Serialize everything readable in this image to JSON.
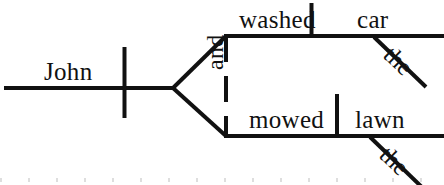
{
  "diagram": {
    "type": "reed-kellogg-sentence-diagram",
    "sentence": "John washed the car and mowed the lawn.",
    "stroke_color": "#111111",
    "background_color": "#ffffff",
    "subject": {
      "label": "John",
      "role": "subject"
    },
    "conjunction": {
      "label": "and",
      "role": "coordinating-conjunction",
      "orientation": "vertical-rotated"
    },
    "branches": [
      {
        "position": "upper",
        "verb": "washed",
        "object": "car",
        "modifier": "the"
      },
      {
        "position": "lower",
        "verb": "mowed",
        "object": "lawn",
        "modifier": "the"
      }
    ],
    "labels": {
      "john": "John",
      "and": "and",
      "washed": "washed",
      "car": "car",
      "the_upper": "the",
      "mowed": "mowed",
      "lawn": "lawn",
      "the_lower": "the"
    }
  }
}
